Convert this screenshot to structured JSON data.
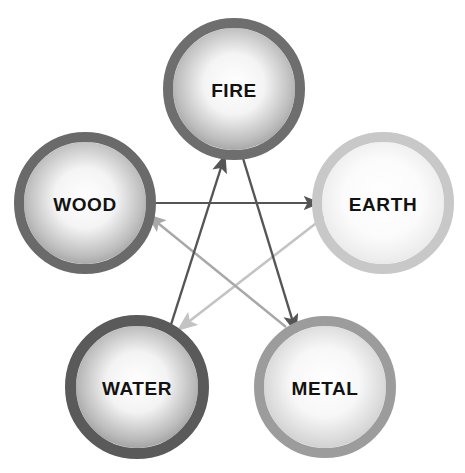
{
  "diagram": {
    "type": "node-link-diagram",
    "background_color": "#ffffff",
    "width": 465,
    "height": 473,
    "nodes": [
      {
        "id": "fire",
        "label": "FIRE",
        "cx": 234,
        "cy": 89,
        "r": 61,
        "ring_color": "#6e6e6e",
        "ring_width": 10,
        "fill_center": "#ffffff",
        "fill_edge": "#8f8f8f",
        "label_color": "#121212"
      },
      {
        "id": "wood",
        "label": "WOOD",
        "cx": 85,
        "cy": 203,
        "r": 61,
        "ring_color": "#6a6a6a",
        "ring_width": 10,
        "fill_center": "#ffffff",
        "fill_edge": "#909090",
        "label_color": "#121212"
      },
      {
        "id": "earth",
        "label": "EARTH",
        "cx": 383,
        "cy": 203,
        "r": 61,
        "ring_color": "#c8c8c8",
        "ring_width": 10,
        "fill_center": "#ffffff",
        "fill_edge": "#dedede",
        "label_color": "#121212"
      },
      {
        "id": "water",
        "label": "WATER",
        "cx": 137,
        "cy": 387,
        "r": 61,
        "ring_color": "#5a5a5a",
        "ring_width": 11,
        "fill_center": "#ffffff",
        "fill_edge": "#8b8b8b",
        "label_color": "#121212"
      },
      {
        "id": "metal",
        "label": "METAL",
        "cx": 325,
        "cy": 387,
        "r": 61,
        "ring_color": "#9c9c9c",
        "ring_width": 10,
        "fill_center": "#ffffff",
        "fill_edge": "#c4c4c4",
        "label_color": "#121212"
      }
    ],
    "arrows": [
      {
        "id": "wood-to-earth",
        "from": "wood",
        "to": "earth",
        "color": "#555555",
        "width": 2.2,
        "x1": 149,
        "y1": 203,
        "x2": 320,
        "y2": 203
      },
      {
        "id": "water-to-fire",
        "from": "water",
        "to": "fire",
        "color": "#555555",
        "width": 2.4,
        "x1": 168,
        "y1": 334,
        "x2": 225,
        "y2": 155
      },
      {
        "id": "fire-to-metal",
        "from": "fire",
        "to": "metal",
        "color": "#555555",
        "width": 2.4,
        "x1": 242,
        "y1": 155,
        "x2": 296,
        "y2": 332
      },
      {
        "id": "earth-to-water",
        "from": "earth",
        "to": "water",
        "color": "#c3c3c3",
        "width": 2.6,
        "x1": 328,
        "y1": 214,
        "x2": 178,
        "y2": 330
      },
      {
        "id": "metal-to-wood",
        "from": "metal",
        "to": "wood",
        "color": "#a8a8a8",
        "width": 2.4,
        "x1": 286,
        "y1": 327,
        "x2": 148,
        "y2": 215
      }
    ]
  }
}
